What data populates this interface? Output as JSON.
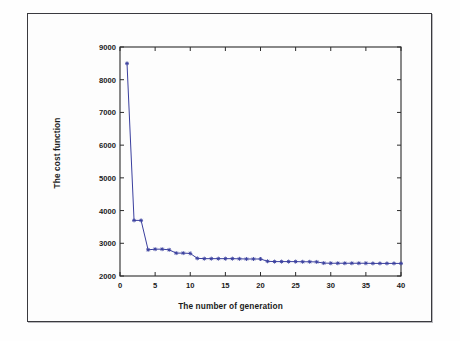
{
  "figure": {
    "background_color": "#fdfdfd",
    "frame_color": "#3a3a3f",
    "series_color": "#3a3f9e",
    "axis_color": "#2b2b2b"
  },
  "chart_data": {
    "type": "line",
    "title": "",
    "xlabel": "The number of generation",
    "ylabel": "The cost function",
    "xlim": [
      0,
      40
    ],
    "ylim": [
      2000,
      9000
    ],
    "xticks": [
      0,
      5,
      10,
      15,
      20,
      25,
      30,
      35,
      40
    ],
    "yticks": [
      2000,
      3000,
      4000,
      5000,
      6000,
      7000,
      8000,
      9000
    ],
    "xtick_labels": [
      "0",
      "5",
      "10",
      "15",
      "20",
      "25",
      "30",
      "35",
      "40"
    ],
    "ytick_labels": [
      "2000",
      "3000",
      "4000",
      "5000",
      "6000",
      "7000",
      "8000",
      "9000"
    ],
    "grid": false,
    "legend": null,
    "marker": "star",
    "line_style": "solid",
    "series": [
      {
        "name": "cost",
        "color": "#3a3f9e",
        "x": [
          1,
          2,
          3,
          4,
          5,
          6,
          7,
          8,
          9,
          10,
          11,
          12,
          13,
          14,
          15,
          16,
          17,
          18,
          19,
          20,
          21,
          22,
          23,
          24,
          25,
          26,
          27,
          28,
          29,
          30,
          31,
          32,
          33,
          34,
          35,
          36,
          37,
          38,
          39,
          40
        ],
        "values": [
          8500,
          3700,
          3700,
          2800,
          2820,
          2820,
          2800,
          2700,
          2700,
          2690,
          2540,
          2530,
          2530,
          2530,
          2530,
          2530,
          2525,
          2520,
          2520,
          2520,
          2450,
          2440,
          2440,
          2440,
          2440,
          2435,
          2435,
          2430,
          2395,
          2390,
          2390,
          2390,
          2390,
          2390,
          2390,
          2385,
          2385,
          2385,
          2385,
          2385
        ]
      }
    ]
  }
}
